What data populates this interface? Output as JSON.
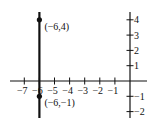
{
  "chart_data": {
    "type": "line",
    "title": "",
    "xlabel": "",
    "ylabel": "",
    "xlim": [
      -7,
      0
    ],
    "ylim": [
      -2,
      4
    ],
    "grid": false,
    "x_ticks": [
      -7,
      -6,
      -5,
      -4,
      -3,
      -2,
      -1
    ],
    "x_tick_labels": [
      "−7",
      "−6",
      "−5",
      "−4",
      "−3",
      "−2",
      "−1"
    ],
    "y_ticks": [
      4,
      3,
      2,
      1,
      -1,
      -2
    ],
    "y_tick_labels": [
      "4",
      "3",
      "2",
      "1",
      "−1",
      "−2"
    ],
    "series": [
      {
        "name": "vertical line x = -6",
        "x": [
          -6,
          -6
        ],
        "y": [
          -2,
          4
        ],
        "color": "#111111"
      }
    ],
    "points": [
      {
        "x": -6,
        "y": 4,
        "label": "(−6,4)"
      },
      {
        "x": -6,
        "y": -1,
        "label": "(−6,−1)"
      }
    ]
  }
}
